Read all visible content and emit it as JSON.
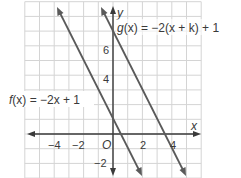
{
  "chart_data": {
    "type": "line",
    "title": "",
    "xlabel": "x",
    "ylabel": "y",
    "origin_label": "O",
    "xlim": [
      -6,
      6
    ],
    "ylim": [
      -3,
      9
    ],
    "grid": true,
    "grid_step": 1,
    "x_ticks": [
      {
        "value": -4,
        "label": "−4"
      },
      {
        "value": -2,
        "label": "−2"
      },
      {
        "value": 2,
        "label": "2"
      },
      {
        "value": 4,
        "label": "4"
      }
    ],
    "y_ticks": [
      {
        "value": -2,
        "label": "−2"
      },
      {
        "value": 4,
        "label": "4"
      },
      {
        "value": 6,
        "label": "6"
      }
    ],
    "series": [
      {
        "name": "f(x) = −2x + 1",
        "slope": -2,
        "intercept": 1,
        "points": [
          [
            -3.82,
            8.64
          ],
          [
            1.93,
            -2.86
          ]
        ],
        "color": "#5a5a5a"
      },
      {
        "name": "g(x) = −2(x + k) + 1",
        "slope": -2,
        "intercept": 7,
        "points": [
          [
            -0.82,
            8.64
          ],
          [
            4.93,
            -2.86
          ]
        ],
        "color": "#5a5a5a"
      }
    ],
    "annotations": [
      {
        "text": "f(x) = −2x + 1",
        "near": "f line, left side"
      },
      {
        "text": "g(x) = −2(x + k) + 1",
        "near": "g line, top right"
      }
    ]
  },
  "labels": {
    "x_axis": "x",
    "y_axis": "y",
    "origin": "O",
    "f_label_name": "f",
    "f_label_rest": "(x) = −2x + 1",
    "g_label_name": "g",
    "g_label_rest": "(x) = −2(x + k) + 1",
    "tick_x_m4": "−4",
    "tick_x_m2": "−2",
    "tick_x_2": "2",
    "tick_x_4": "4",
    "tick_y_m2": "−2",
    "tick_y_4": "4",
    "tick_y_6": "6"
  },
  "colors": {
    "grid": "#d4d4d4",
    "axis": "#3a3a3a",
    "line": "#5a5a5a",
    "text": "#3a3a3a"
  }
}
